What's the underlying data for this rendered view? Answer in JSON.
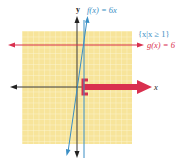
{
  "diagram": {
    "type": "coordinate-graph",
    "axes": {
      "x_label": "x",
      "y_label": "y"
    },
    "functions": [
      {
        "name": "f",
        "label": "f(x) = 6x",
        "color": "#3a8ec4",
        "description": "steep line through origin"
      },
      {
        "name": "g",
        "label": "g(x) = 6",
        "color": "#d9304f",
        "description": "horizontal line"
      }
    ],
    "inverse_line": {
      "color": "#3a8ec4",
      "description": "vertical line near x = 1"
    },
    "domain_set": {
      "label": "{x|x ≥ 1}",
      "color": "#3a8ec4"
    },
    "domain_ray": {
      "color": "#d9304f",
      "description": "thick ray starting with bracket at x = 1 pointing right"
    },
    "colors": {
      "grid_fill": "#f7e49a",
      "grid_lines": "#fdf5d6",
      "axis": "#222222"
    }
  }
}
